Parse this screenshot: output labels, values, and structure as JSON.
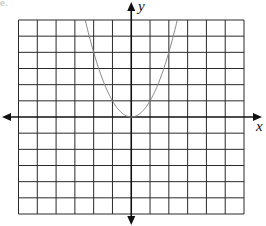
{
  "fragment_text": "e.",
  "chart_data": {
    "type": "line",
    "title": "",
    "xlabel": "x",
    "ylabel": "y",
    "xlim": [
      -6,
      6
    ],
    "ylim": [
      -6,
      6
    ],
    "grid": true,
    "grid_step": 1,
    "x_ticks_labeled": false,
    "y_ticks_labeled": false,
    "legend": "none",
    "series": [
      {
        "name": "y = x^2",
        "equation": "y = x^2",
        "x": [
          -2.45,
          -2,
          -1.5,
          -1,
          -0.5,
          0,
          0.5,
          1,
          1.5,
          2,
          2.45
        ],
        "y": [
          6,
          4,
          2.25,
          1,
          0.25,
          0,
          0.25,
          1,
          2.25,
          4,
          6
        ],
        "color": "#888888"
      }
    ]
  },
  "colors": {
    "grid": "#2a2a2a",
    "axis": "#111111",
    "curve": "#8a8a8a"
  },
  "layout": {
    "grid_left": 18.5,
    "grid_right": 244,
    "grid_top": 20,
    "grid_bottom": 214
  }
}
